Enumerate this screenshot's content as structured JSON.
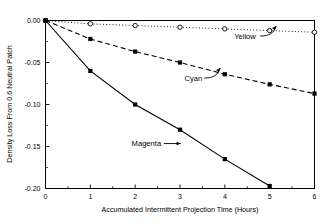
{
  "chart_data": {
    "type": "line",
    "title": "",
    "subtitle": "",
    "xlabel": "Accumulated Intermittent Projection Time (Hours)",
    "ylabel": "Density Loss From 0.6 Neutral Patch",
    "xlim": [
      0,
      6
    ],
    "ylim": [
      -0.2,
      0.0
    ],
    "xticks": [
      0,
      1,
      2,
      3,
      4,
      5,
      6
    ],
    "xtick_labels": [
      "0",
      "1",
      "2",
      "3",
      "4",
      "5",
      "6"
    ],
    "yticks": [
      0.0,
      -0.05,
      -0.1,
      -0.15,
      -0.2
    ],
    "ytick_labels": [
      "0.00",
      "-0.05",
      "-0.10",
      "-0.15",
      "-0.20"
    ],
    "x_minor_ticks": [
      0.5,
      1.5,
      2.5,
      3.5,
      4.5,
      5.5
    ],
    "y_minor_ticks": [
      -0.025,
      -0.075,
      -0.125,
      -0.175
    ],
    "grid": false,
    "legend_position": "inline-annotations",
    "series": [
      {
        "name": "Yellow",
        "marker": "open-circle",
        "linestyle": "dotted",
        "color": "#000000",
        "x": [
          0,
          1,
          2,
          3,
          4,
          5,
          6
        ],
        "values": [
          0.0,
          -0.004,
          -0.006,
          -0.008,
          -0.01,
          -0.012,
          -0.014
        ]
      },
      {
        "name": "Cyan",
        "marker": "filled-square",
        "linestyle": "dashed",
        "color": "#000000",
        "x": [
          0,
          1,
          2,
          3,
          4,
          5,
          6
        ],
        "values": [
          0.0,
          -0.022,
          -0.037,
          -0.05,
          -0.064,
          -0.076,
          -0.087
        ]
      },
      {
        "name": "Magenta",
        "marker": "filled-square",
        "linestyle": "solid",
        "color": "#000000",
        "x": [
          0,
          1,
          2,
          3,
          4,
          5
        ],
        "values": [
          0.0,
          -0.06,
          -0.1,
          -0.13,
          -0.165,
          -0.197
        ]
      }
    ],
    "annotations": [
      {
        "text": "Yellow",
        "x": 4.45,
        "y": -0.0185,
        "arrow": "curved-up-right"
      },
      {
        "text": "Cyan",
        "x": 3.3,
        "y": -0.0685,
        "arrow": "curved-up-right"
      },
      {
        "text": "Magenta",
        "x": 2.25,
        "y": -0.1465,
        "arrow": "straight-right"
      }
    ]
  }
}
